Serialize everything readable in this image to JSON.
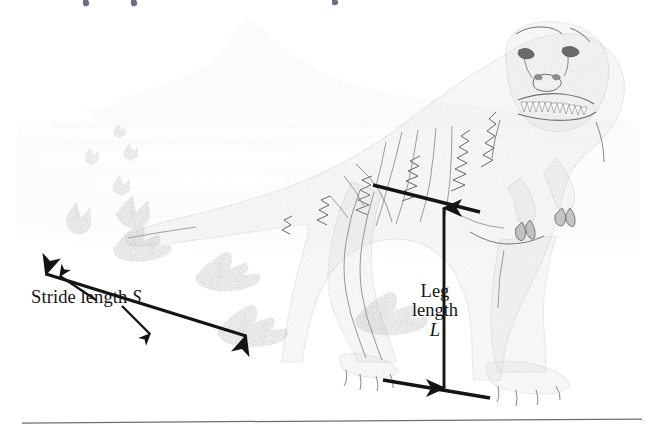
{
  "figure": {
    "name": "dinosaur-stride-length-diagram",
    "background_color": "#ffffff",
    "ink_color": "#141414",
    "body_fill": "#c9c9c9",
    "body_stroke": "#6b6b6b",
    "ground_fill": "#ececec",
    "sky_fill": "#ffffff",
    "mountain_fill": "#ededed",
    "footprint_fill": "#9a9a9a",
    "footprint_stroke": "#7d7d7d"
  },
  "labels": {
    "stride": {
      "text_prefix": "Stride length ",
      "symbol": "S",
      "full_text": "Stride length S"
    },
    "leg": {
      "line1": "Leg",
      "line2": "length",
      "symbol": "L",
      "full_text": "Leg length L"
    }
  },
  "annotations": {
    "stride_measure": {
      "name": "stride-length-double-arrow",
      "from_footprint": "rear-left-track",
      "to_footprint": "front-right-track",
      "arrowheads": "both"
    },
    "leg_measure": {
      "name": "leg-length-double-arrow",
      "from": "hip-joint",
      "to": "ground-level",
      "arrowheads": "both"
    },
    "stride_leader_upper": {
      "name": "stride-label-leader-up",
      "arrowheads": "end"
    },
    "stride_leader_lower": {
      "name": "stride-label-leader-down",
      "arrowheads": "end"
    }
  },
  "scene_elements": {
    "mountain": "background-mountain",
    "horizon": "horizon-band",
    "ground": "ground-plane",
    "dinosaur": "theropod-dinosaur",
    "trackway_count": 4,
    "distant_tracks_count": 4,
    "page_rule": "page-bottom-rule",
    "cropped_text_fragments": 3
  }
}
